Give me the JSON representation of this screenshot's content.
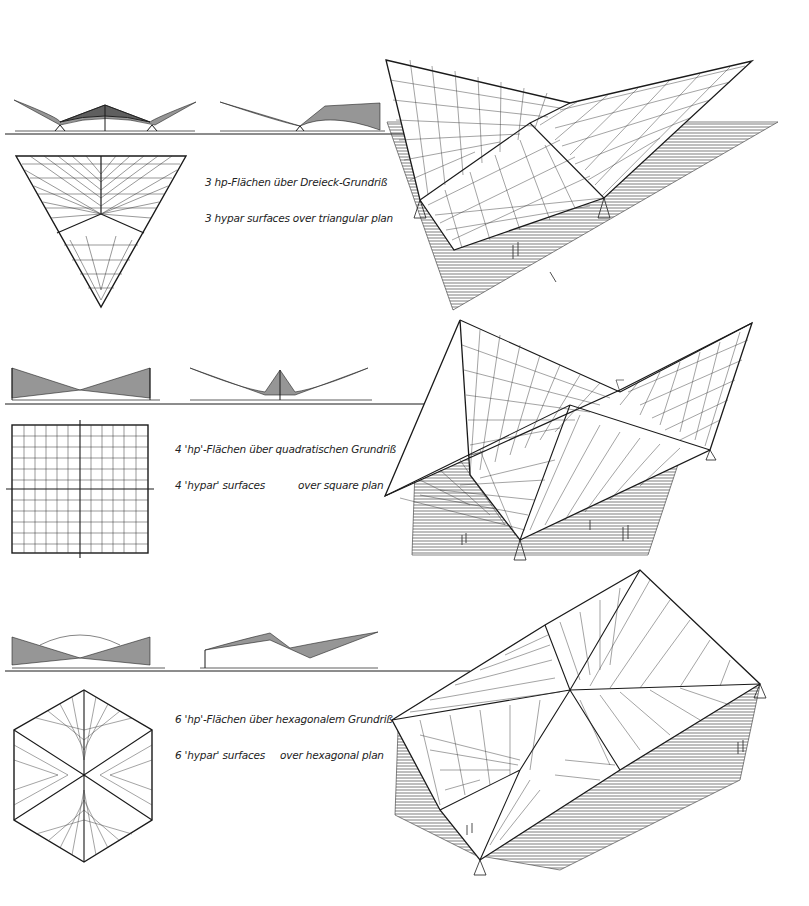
{
  "plate": {
    "rows": [
      {
        "id": "triangular",
        "caption_de": "3 hp-Flächen über Dreieck-Grundriß",
        "caption_en": "3 hypar surfaces over triangular plan",
        "plan_shape": "triangle",
        "surfaces": 3
      },
      {
        "id": "square",
        "caption_de": "4 'hp'-Flächen über quadratischen Grundriß",
        "caption_en_a": "4 'hypar' surfaces",
        "caption_en_b": "over square plan",
        "plan_shape": "square",
        "surfaces": 4
      },
      {
        "id": "hexagonal",
        "caption_de": "6 'hp'-Flächen über hexagonalem Grundriß",
        "caption_en_a": "6 'hypar' surfaces",
        "caption_en_b": "over hexagonal plan",
        "plan_shape": "hexagon",
        "surfaces": 6
      }
    ],
    "colors": {
      "ink": "#1a1a1a",
      "hatch": "#555555",
      "paper": "#ffffff"
    }
  }
}
